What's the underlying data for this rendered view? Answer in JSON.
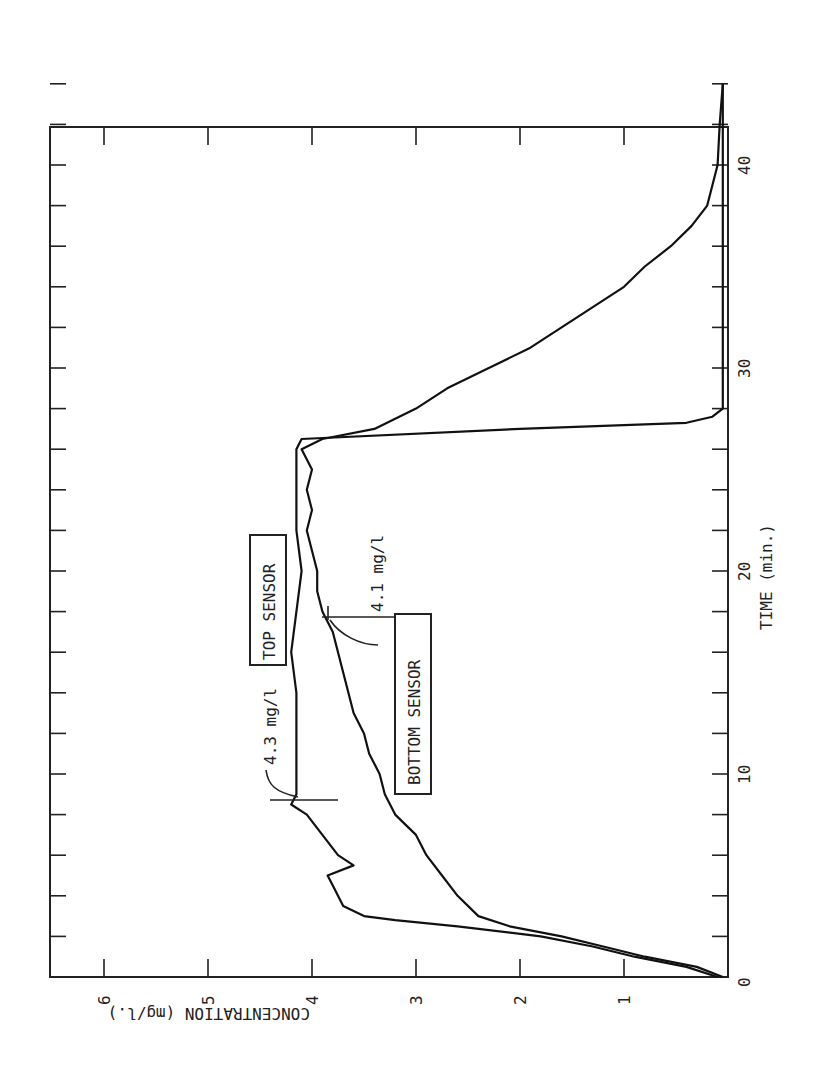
{
  "chart_data": {
    "type": "line",
    "orientation": "rotated 90deg counter-clockwise (time axis vertical on right, concentration axis horizontal along bottom)",
    "title": "",
    "xlabel": "TIME (min.)",
    "ylabel": "CONCENTRATION (mg/l.)",
    "xlim": [
      0,
      44
    ],
    "ylim": [
      0,
      6.4
    ],
    "x_ticks": [
      0,
      10,
      20,
      30,
      40
    ],
    "x_tick_labels": [
      "0",
      "10",
      "20",
      "30",
      "40"
    ],
    "x_minor_step": 2,
    "y_ticks": [
      1,
      2,
      3,
      4,
      5,
      6
    ],
    "y_tick_labels": [
      "1",
      "2",
      "3",
      "4",
      "5",
      "6"
    ],
    "grid": false,
    "series": [
      {
        "name": "TOP SENSOR",
        "x": [
          0,
          0.5,
          1,
          1.5,
          2,
          2.5,
          2.8,
          3,
          3.5,
          4,
          4.5,
          5,
          5.5,
          6,
          7,
          8,
          8.5,
          9,
          10,
          12,
          14,
          16,
          18,
          20,
          22,
          24,
          26,
          26.5,
          27,
          27.3,
          27.6,
          28,
          30,
          35,
          40,
          44
        ],
        "values": [
          0.1,
          0.4,
          0.9,
          1.3,
          1.8,
          2.6,
          3.2,
          3.5,
          3.7,
          3.75,
          3.8,
          3.85,
          3.6,
          3.75,
          3.9,
          4.05,
          4.2,
          4.15,
          4.15,
          4.15,
          4.15,
          4.2,
          4.15,
          4.1,
          4.15,
          4.15,
          4.15,
          4.1,
          2.0,
          0.4,
          0.15,
          0.05,
          0.05,
          0.05,
          0.05,
          0.05
        ]
      },
      {
        "name": "BOTTOM SENSOR",
        "x": [
          0,
          0.5,
          1,
          1.5,
          2,
          2.5,
          3,
          4,
          5,
          6,
          7,
          8,
          9,
          10,
          11,
          12,
          13,
          14,
          15,
          16,
          17,
          18,
          19,
          20,
          21,
          22,
          23,
          24,
          25,
          26,
          26.5,
          27,
          28,
          29,
          30,
          31,
          32,
          33,
          34,
          35,
          36,
          37,
          38,
          39,
          40,
          42,
          44
        ],
        "values": [
          0.05,
          0.3,
          0.8,
          1.2,
          1.6,
          2.1,
          2.4,
          2.6,
          2.75,
          2.9,
          3.0,
          3.2,
          3.3,
          3.35,
          3.45,
          3.5,
          3.6,
          3.65,
          3.7,
          3.75,
          3.8,
          3.9,
          3.95,
          3.95,
          4.0,
          4.05,
          4.0,
          4.05,
          4.0,
          4.1,
          3.9,
          3.4,
          3.0,
          2.7,
          2.3,
          1.9,
          1.6,
          1.3,
          1.0,
          0.8,
          0.55,
          0.35,
          0.2,
          0.15,
          0.1,
          0.08,
          0.05
        ]
      }
    ],
    "annotations": [
      {
        "text": "TOP SENSOR",
        "boxed": true
      },
      {
        "text": "BOTTOM SENSOR",
        "boxed": true
      },
      {
        "text": "4.3 mg/l",
        "points_to": {
          "series": "TOP SENSOR",
          "x": 8.5,
          "y": 4.2
        }
      },
      {
        "text": "4.1 mg/l",
        "points_to": {
          "series": "BOTTOM SENSOR",
          "x": 18,
          "y": 3.85
        }
      }
    ]
  },
  "labels": {
    "time_axis": "TIME (min.)",
    "conc_axis": "CONCENTRATION (mg/l.)",
    "top_sensor": "TOP SENSOR",
    "bottom_sensor": "BOTTOM SENSOR",
    "ann_top": "4.3 mg/l",
    "ann_bottom": "4.1 mg/l"
  }
}
